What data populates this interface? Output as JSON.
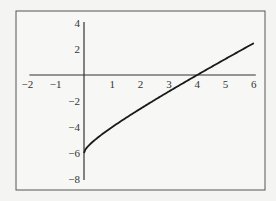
{
  "chart_data": {
    "type": "line",
    "title": "",
    "xlabel": "",
    "ylabel": "",
    "xlim": [
      -2,
      6
    ],
    "ylim": [
      -8,
      4
    ],
    "x_ticks": [
      -2,
      -1,
      1,
      2,
      3,
      4,
      5,
      6
    ],
    "x_tick_labels": [
      "−2",
      "−1",
      "1",
      "2",
      "3",
      "4",
      "5",
      "6"
    ],
    "y_ticks": [
      4,
      2,
      -2,
      -4,
      -6,
      -8
    ],
    "y_tick_labels": [
      "4",
      "2",
      "−2",
      "−4",
      "−6",
      "−8"
    ],
    "grid": false,
    "legend": null,
    "series": [
      {
        "name": "f(x)",
        "x": [
          0,
          0.25,
          0.5,
          1,
          1.5,
          2,
          2.5,
          3,
          3.5,
          4,
          4.5,
          5,
          5.5,
          6
        ],
        "values": [
          -6,
          -5.25,
          -4.79,
          -4,
          -3.28,
          -2.59,
          -1.92,
          -1.27,
          -0.63,
          0,
          0.62,
          1.24,
          1.85,
          2.45
        ]
      }
    ],
    "annotations": []
  },
  "colors": {
    "background": "#f4f4f2",
    "frame": "#555555",
    "axis": "#333333",
    "curve": "#1a1a1a"
  }
}
